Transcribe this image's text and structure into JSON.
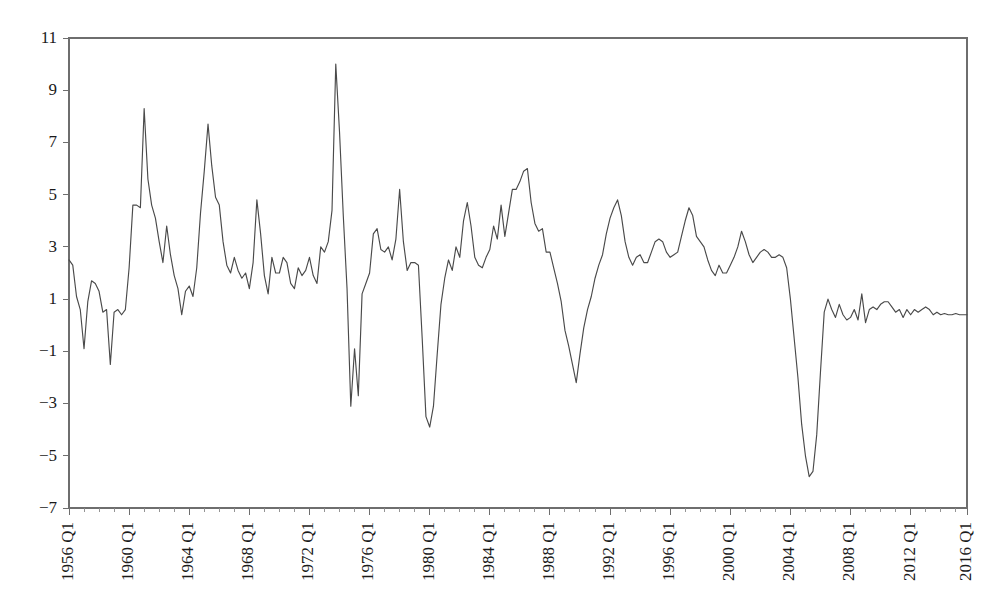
{
  "chart_data": {
    "type": "line",
    "title": "",
    "subtitle": "",
    "xlabel": "",
    "ylabel": "",
    "xlim": [
      "1956 Q1",
      "2017 Q4"
    ],
    "ylim": [
      -7,
      11
    ],
    "grid": false,
    "legend": null,
    "y_ticks": [
      11,
      9,
      7,
      5,
      3,
      1,
      -1,
      -3,
      -5,
      -7
    ],
    "y_tick_labels": [
      "11",
      "9",
      "7",
      "5",
      "3",
      "1",
      "-1",
      "-3",
      "-5",
      "-7"
    ],
    "x_tick_labels": [
      "1956 Q1",
      "1960 Q1",
      "1964 Q1",
      "1968 Q1",
      "1972 Q1",
      "1976 Q1",
      "1980 Q1",
      "1984 Q1",
      "1988 Q1",
      "1992 Q1",
      "1996 Q1",
      "2000 Q1",
      "2004 Q1",
      "2008 Q1",
      "2012 Q1",
      "2016 Q1"
    ],
    "x_tick_label_rotation": -90,
    "x_tick_interval_years": 4,
    "x_minor_tick_interval_years": 1,
    "line_color": "#4a4a4a",
    "axis_color": "#6e6e6e",
    "background_color": "#ffffff",
    "series": [
      {
        "name": "Growth rate",
        "start_period": "1956 Q1",
        "frequency": "quarterly",
        "values": [
          2.5,
          2.3,
          1.1,
          0.6,
          -0.9,
          0.9,
          1.7,
          1.6,
          1.3,
          0.5,
          0.6,
          -1.5,
          0.5,
          0.6,
          0.4,
          0.6,
          2.2,
          4.6,
          4.6,
          4.5,
          8.3,
          5.6,
          4.6,
          4.1,
          3.2,
          2.4,
          3.8,
          2.7,
          1.9,
          1.4,
          0.4,
          1.3,
          1.5,
          1.1,
          2.2,
          4.3,
          5.9,
          7.7,
          6.1,
          4.9,
          4.6,
          3.2,
          2.3,
          2.0,
          2.6,
          2.1,
          1.8,
          2.0,
          1.4,
          2.4,
          4.8,
          3.5,
          1.9,
          1.2,
          2.6,
          2.0,
          2.0,
          2.6,
          2.4,
          1.6,
          1.4,
          2.2,
          1.9,
          2.1,
          2.6,
          1.9,
          1.6,
          3.0,
          2.8,
          3.2,
          4.4,
          10.0,
          7.4,
          4.2,
          1.4,
          -3.1,
          -0.9,
          -2.7,
          1.2,
          1.6,
          2.0,
          3.5,
          3.7,
          2.9,
          2.8,
          3.0,
          2.5,
          3.3,
          5.2,
          3.2,
          2.1,
          2.4,
          2.4,
          2.3,
          -0.5,
          -3.5,
          -3.9,
          -3.1,
          -1.1,
          0.8,
          1.8,
          2.5,
          2.1,
          3.0,
          2.6,
          4.0,
          4.7,
          3.8,
          2.6,
          2.3,
          2.2,
          2.6,
          2.9,
          3.8,
          3.3,
          4.6,
          3.4,
          4.3,
          5.2,
          5.2,
          5.5,
          5.9,
          6.0,
          4.7,
          3.9,
          3.6,
          3.7,
          2.8,
          2.8,
          2.2,
          1.6,
          0.9,
          -0.2,
          -0.8,
          -1.5,
          -2.2,
          -1.1,
          -0.1,
          0.6,
          1.1,
          1.8,
          2.3,
          2.7,
          3.5,
          4.1,
          4.5,
          4.8,
          4.2,
          3.2,
          2.6,
          2.3,
          2.6,
          2.7,
          2.4,
          2.4,
          2.8,
          3.2,
          3.3,
          3.2,
          2.8,
          2.6,
          2.7,
          2.8,
          3.4,
          4.0,
          4.5,
          4.2,
          3.4,
          3.2,
          3.0,
          2.5,
          2.1,
          1.9,
          2.3,
          2.0,
          2.0,
          2.3,
          2.6,
          3.0,
          3.6,
          3.2,
          2.7,
          2.4,
          2.6,
          2.8,
          2.9,
          2.8,
          2.6,
          2.6,
          2.7,
          2.6,
          2.2,
          1.0,
          -0.5,
          -2.0,
          -3.8,
          -5.0,
          -5.8,
          -5.6,
          -4.2,
          -1.8,
          0.5,
          1.0,
          0.6,
          0.3,
          0.8,
          0.4,
          0.2,
          0.3,
          0.6,
          0.2,
          1.2,
          0.1,
          0.6,
          0.7,
          0.6,
          0.8,
          0.9,
          0.9,
          0.7,
          0.5,
          0.6,
          0.3,
          0.6,
          0.4,
          0.6,
          0.5,
          0.6,
          0.7,
          0.6,
          0.4,
          0.5,
          0.4,
          0.45,
          0.4,
          0.4,
          0.45,
          0.4,
          0.4,
          0.4
        ]
      }
    ]
  }
}
